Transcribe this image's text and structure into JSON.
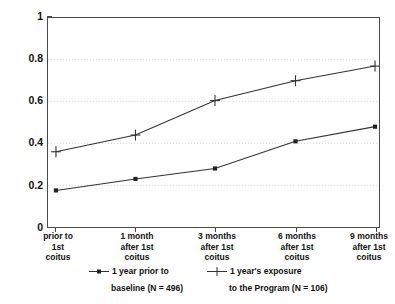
{
  "chart_data": {
    "type": "line",
    "title": "",
    "xlabel": "",
    "ylabel": "",
    "ylim": [
      0,
      1
    ],
    "grid": true,
    "legend_position": "bottom",
    "categories": [
      "prior to\n1st\ncoitus",
      "1 month\nafter 1st\ncoitus",
      "3 months\nafter 1st\ncoitus",
      "6 months\nafter 1st\ncoitus",
      "9 months\nafter 1st\ncoitus"
    ],
    "y_ticks": [
      "0",
      "0.2",
      "0.4",
      "0.6",
      "0.8",
      "1"
    ],
    "y_tick_values": [
      0,
      0.2,
      0.4,
      0.6,
      0.8,
      1
    ],
    "series": [
      {
        "name": "1 year prior to baseline (N = 496)",
        "marker": "square",
        "values": [
          0.175,
          0.23,
          0.28,
          0.41,
          0.48
        ]
      },
      {
        "name": "1 year's exposure to the Program (N = 106)",
        "marker": "plus",
        "values": [
          0.36,
          0.44,
          0.605,
          0.7,
          0.77
        ]
      }
    ]
  },
  "y_axis": {
    "ticks": [
      {
        "label": "1",
        "value": 1
      },
      {
        "label": "0.8",
        "value": 0.8
      },
      {
        "label": "0.6",
        "value": 0.6
      },
      {
        "label": "0.4",
        "value": 0.4
      },
      {
        "label": "0.2",
        "value": 0.2
      },
      {
        "label": "0",
        "value": 0
      }
    ]
  },
  "x_axis": {
    "ticks": [
      {
        "line1": "prior to",
        "line2": "1st",
        "line3": "coitus"
      },
      {
        "line1": "1 month",
        "line2": "after 1st",
        "line3": "coitus"
      },
      {
        "line1": "3 months",
        "line2": "after 1st",
        "line3": "coitus"
      },
      {
        "line1": "6 months",
        "line2": "after 1st",
        "line3": "coitus"
      },
      {
        "line1": "9 months",
        "line2": "after 1st",
        "line3": "coitus"
      }
    ]
  },
  "legend": {
    "entries": [
      {
        "line1": "1 year prior to",
        "line2": "baseline (N = 496)",
        "marker": "square"
      },
      {
        "line1": "1 year's exposure",
        "line2": "to the Program (N = 106)",
        "marker": "plus"
      }
    ]
  },
  "colors": {
    "line": "#333333",
    "axis": "#4a4a4a",
    "grid": "#d9d9d9",
    "background": "#ffffff",
    "text": "#111111"
  }
}
